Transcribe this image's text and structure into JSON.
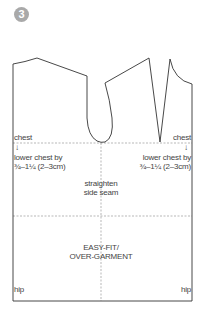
{
  "step": {
    "number": "3",
    "badge_color": "#a9a9a9"
  },
  "labels": {
    "chest_left": "chest",
    "chest_right": "chest",
    "lower_chest_left_line1": "lower chest by",
    "lower_chest_left_line2": "¾–1¼ (2–3cm)",
    "lower_chest_right_line1": "lower chest by",
    "lower_chest_right_line2": "¾–1¼ (2–3cm)",
    "straighten_line1": "straighten",
    "straighten_line2": "side seam",
    "fit_line1": "EASY-FIT/",
    "fit_line2": "OVER-GARMENT",
    "hip_left": "hip",
    "hip_right": "hip"
  },
  "icons": {
    "arrow_down": "↓"
  },
  "colors": {
    "outline": "#333333",
    "guide": "#9a9a9a",
    "text": "#444444"
  }
}
